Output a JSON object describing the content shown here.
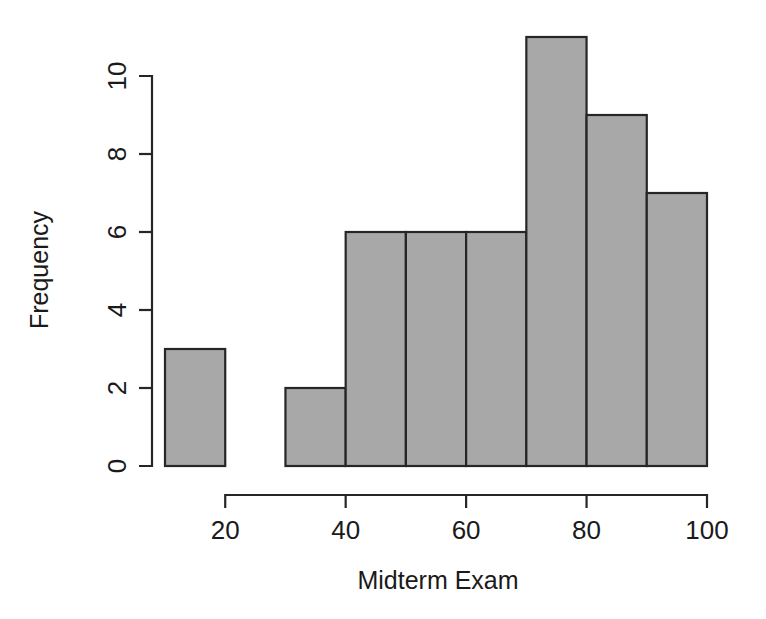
{
  "chart_data": {
    "type": "bar",
    "title": "",
    "subtitle": "",
    "xlabel": "Midterm Exam",
    "ylabel": "Frequency",
    "xlim": [
      10,
      100
    ],
    "ylim": [
      0,
      11
    ],
    "grid": false,
    "legend": null,
    "bin_width": 10,
    "bin_edges": [
      10,
      20,
      30,
      40,
      50,
      60,
      70,
      80,
      90,
      100
    ],
    "categories": [
      "10-20",
      "20-30",
      "30-40",
      "40-50",
      "50-60",
      "60-70",
      "70-80",
      "80-90",
      "90-100"
    ],
    "values": [
      3,
      0,
      2,
      6,
      6,
      6,
      11,
      9,
      7
    ],
    "x_tick_values": [
      20,
      40,
      60,
      80,
      100
    ],
    "x_tick_labels": [
      "20",
      "40",
      "60",
      "80",
      "100"
    ],
    "x_axis_range_drawn": [
      20,
      100
    ],
    "y_tick_values": [
      0,
      2,
      4,
      6,
      8,
      10
    ],
    "y_tick_labels": [
      "0",
      "2",
      "4",
      "6",
      "8",
      "10"
    ],
    "bar_fill_color": "#a8a8a8",
    "bar_border_color": "#262626",
    "background_color": "#ffffff",
    "total_count": 50
  },
  "figure": {
    "name": "histogram-midterm-exam"
  }
}
